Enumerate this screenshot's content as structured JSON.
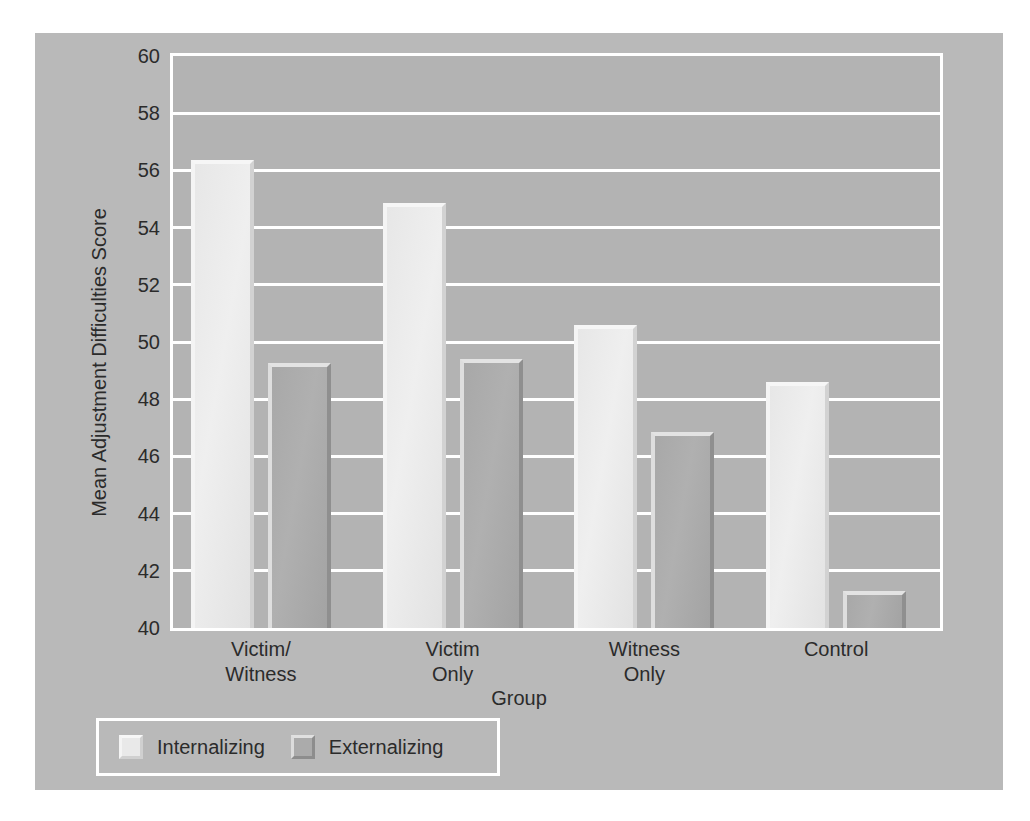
{
  "chart_data": {
    "type": "bar",
    "title": "",
    "xlabel": "Group",
    "ylabel": "Mean Adjustment Difficulties Score",
    "ylim": [
      40,
      60
    ],
    "yticks": [
      40,
      42,
      44,
      46,
      48,
      50,
      52,
      54,
      56,
      58,
      60
    ],
    "ytick_labels": [
      "40",
      "42",
      "44",
      "46",
      "48",
      "50",
      "52",
      "54",
      "56",
      "58",
      "60"
    ],
    "grid": true,
    "legend_position": "below-left",
    "categories": [
      "Victim/\nWitness",
      "Victim\nOnly",
      "Witness\nOnly",
      "Control"
    ],
    "category_lines": [
      [
        "Victim/",
        "Witness"
      ],
      [
        "Victim",
        "Only"
      ],
      [
        "Witness",
        "Only"
      ],
      [
        "Control"
      ]
    ],
    "series": [
      {
        "name": "Internalizing",
        "color": "#e9e9e9",
        "values": [
          56.35,
          54.85,
          50.6,
          48.6
        ]
      },
      {
        "name": "Externalizing",
        "color": "#ababab",
        "values": [
          49.25,
          49.4,
          46.85,
          41.3
        ]
      }
    ]
  },
  "colors": {
    "figure_background": "#ffffff",
    "chart_background": "#b9b9b9",
    "plot_background": "#b3b3b3",
    "gridline": "#ffffff",
    "frame": "#ffffff",
    "text": "#2b2b2b",
    "internalizing": "#e9e9e9",
    "externalizing": "#ababab"
  }
}
